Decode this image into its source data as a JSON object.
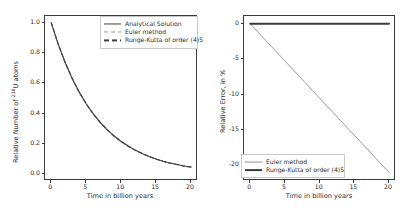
{
  "figure": {
    "panels": [
      "decay-curve",
      "relative-error"
    ],
    "background": "#ffffff",
    "foreground": "#2b2b2b"
  },
  "colors": {
    "analytical": "#3c3c3c",
    "euler": "#9a9a9a",
    "runge_kutta": "#3c3c3c",
    "axis": "#3a3a3a",
    "legend_border": "#c9c9c9"
  },
  "left_panel": {
    "xlabel": "Time in billion years",
    "ylabel_prefix": "Relative Number of ",
    "ylabel_isotope_mass": "238",
    "ylabel_isotope_symbol": "U",
    "ylabel_suffix": " atoms",
    "xticks": [
      "0",
      "5",
      "10",
      "15",
      "20"
    ],
    "yticks": [
      "0.0",
      "0.2",
      "0.4",
      "0.6",
      "0.8",
      "1.0"
    ],
    "legend": [
      {
        "label": "Analytical Solution",
        "style": "solid"
      },
      {
        "label": "Euler method",
        "style": "dashed-light"
      },
      {
        "label": "Runge-Kutta of order (4)5",
        "style": "dashed-dark"
      }
    ]
  },
  "right_panel": {
    "xlabel": "Time in billion years",
    "ylabel": "Relative Error, in %",
    "xticks": [
      "0",
      "5",
      "10",
      "15",
      "20"
    ],
    "yticks": [
      "-20",
      "-15",
      "-10",
      "-5",
      "0"
    ],
    "legend": [
      {
        "label": "Euler method",
        "style": "thin"
      },
      {
        "label": "Runge-Kutta of order (4)5",
        "style": "thick"
      }
    ]
  },
  "chart_data": [
    {
      "type": "line",
      "id": "decay-curve",
      "title": "",
      "xlabel": "Time in billion years",
      "ylabel": "Relative Number of 238U atoms",
      "xlim": [
        -0.9,
        21.0
      ],
      "ylim": [
        -0.045,
        1.045
      ],
      "xticks": [
        0,
        5,
        10,
        15,
        20
      ],
      "yticks": [
        0.0,
        0.2,
        0.4,
        0.6,
        0.8,
        1.0
      ],
      "grid": false,
      "legend_position": "upper right",
      "x": [
        0,
        1,
        2,
        3,
        4,
        5,
        6,
        7,
        8,
        9,
        10,
        11,
        12,
        13,
        14,
        15,
        16,
        17,
        18,
        19,
        20
      ],
      "series": [
        {
          "name": "Analytical Solution",
          "style": "solid",
          "color": "#3c3c3c",
          "values": [
            1.0,
            0.858,
            0.736,
            0.632,
            0.542,
            0.465,
            0.399,
            0.342,
            0.294,
            0.252,
            0.216,
            0.186,
            0.159,
            0.137,
            0.117,
            0.1,
            0.086,
            0.074,
            0.064,
            0.054,
            0.047
          ]
        },
        {
          "name": "Euler method",
          "style": "dashed",
          "color": "#9a9a9a",
          "values": [
            1.0,
            0.857,
            0.734,
            0.629,
            0.539,
            0.462,
            0.396,
            0.339,
            0.291,
            0.249,
            0.214,
            0.183,
            0.157,
            0.134,
            0.115,
            0.099,
            0.084,
            0.072,
            0.062,
            0.053,
            0.045
          ]
        },
        {
          "name": "Runge-Kutta of order (4)5",
          "style": "dashed",
          "color": "#3c3c3c",
          "values": [
            1.0,
            0.858,
            0.736,
            0.632,
            0.542,
            0.465,
            0.399,
            0.342,
            0.294,
            0.252,
            0.216,
            0.186,
            0.159,
            0.137,
            0.117,
            0.1,
            0.086,
            0.074,
            0.064,
            0.054,
            0.047
          ]
        }
      ]
    },
    {
      "type": "line",
      "id": "relative-error",
      "title": "",
      "xlabel": "Time in billion years",
      "ylabel": "Relative Error, in %",
      "xlim": [
        -0.9,
        21.0
      ],
      "ylim": [
        -22.2,
        1.1
      ],
      "xticks": [
        0,
        5,
        10,
        15,
        20
      ],
      "yticks": [
        -20,
        -15,
        -10,
        -5,
        0
      ],
      "grid": false,
      "legend_position": "lower left",
      "x": [
        0,
        1,
        2,
        3,
        4,
        5,
        6,
        7,
        8,
        9,
        10,
        11,
        12,
        13,
        14,
        15,
        16,
        17,
        18,
        19,
        20
      ],
      "series": [
        {
          "name": "Euler method",
          "style": "solid-thin",
          "color": "#8f8f8f",
          "values": [
            0.0,
            -1.05,
            -2.1,
            -3.15,
            -4.2,
            -5.25,
            -6.3,
            -7.35,
            -8.4,
            -9.45,
            -10.5,
            -11.55,
            -12.6,
            -13.65,
            -14.7,
            -15.75,
            -16.8,
            -17.85,
            -18.9,
            -19.95,
            -21.0
          ]
        },
        {
          "name": "Runge-Kutta of order (4)5",
          "style": "solid-thick",
          "color": "#3c3c3c",
          "values": [
            0.0,
            0.0,
            0.0,
            0.0,
            0.0,
            0.0,
            0.0,
            0.0,
            0.0,
            0.0,
            0.0,
            0.0,
            0.0,
            0.0,
            0.0,
            0.0,
            0.0,
            0.0,
            0.0,
            0.0,
            0.0
          ]
        }
      ]
    }
  ]
}
